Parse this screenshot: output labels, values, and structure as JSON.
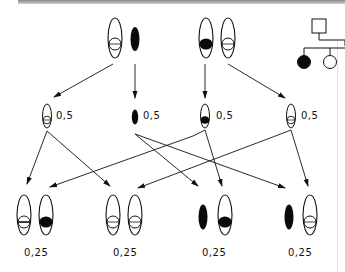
{
  "figure": {
    "type": "genetics-inheritance-diagram"
  },
  "parents": [
    {
      "id": "parent-1",
      "chromosomes": [
        {
          "x": 115,
          "y": 38,
          "type": "open-ellipse",
          "marker": "open-circle"
        },
        {
          "x": 135,
          "y": 38,
          "type": "solid-ellipse",
          "marker": "none"
        }
      ]
    },
    {
      "id": "parent-2",
      "chromosomes": [
        {
          "x": 206,
          "y": 38,
          "type": "open-ellipse",
          "marker": "filled-circle"
        },
        {
          "x": 228,
          "y": 38,
          "type": "open-ellipse",
          "marker": "open-circle"
        }
      ]
    }
  ],
  "gametes": [
    {
      "x": 47,
      "y": 116,
      "type": "open-ellipse",
      "marker": "open-circle",
      "probability": "0,5"
    },
    {
      "x": 135,
      "y": 116,
      "type": "solid-ellipse",
      "marker": "none",
      "probability": "0,5"
    },
    {
      "x": 205,
      "y": 116,
      "type": "open-ellipse",
      "marker": "filled-circle",
      "probability": "0,5"
    },
    {
      "x": 291,
      "y": 116,
      "type": "open-ellipse",
      "marker": "open-circle",
      "probability": "0,5"
    }
  ],
  "offspring": [
    {
      "probability": "0,25",
      "label_x": 24,
      "chromosomes": [
        {
          "x": 24,
          "type": "open-ellipse",
          "marker": "open-circle"
        },
        {
          "x": 46,
          "type": "open-ellipse",
          "marker": "filled-circle"
        }
      ]
    },
    {
      "probability": "0,25",
      "label_x": 113,
      "chromosomes": [
        {
          "x": 113,
          "type": "open-ellipse",
          "marker": "open-circle"
        },
        {
          "x": 135,
          "type": "open-ellipse",
          "marker": "open-circle"
        }
      ]
    },
    {
      "probability": "0,25",
      "label_x": 202,
      "chromosomes": [
        {
          "x": 203,
          "type": "solid-ellipse",
          "marker": "none"
        },
        {
          "x": 225,
          "type": "open-ellipse",
          "marker": "filled-circle"
        }
      ]
    },
    {
      "probability": "0,25",
      "label_x": 289,
      "chromosomes": [
        {
          "x": 289,
          "type": "solid-ellipse",
          "marker": "none"
        },
        {
          "x": 310,
          "type": "open-ellipse",
          "marker": "open-circle"
        }
      ]
    }
  ],
  "labels": {
    "gamete_probability": "0,5",
    "offspring_probability": "0,25"
  },
  "pedigree": {
    "father": {
      "shape": "square",
      "affected": false
    },
    "children": [
      {
        "shape": "circle",
        "affected": true
      },
      {
        "shape": "circle",
        "affected": false
      }
    ]
  },
  "colors": {
    "line": "#111111",
    "fill": "#0a0a0a",
    "background": "#ffffff"
  }
}
